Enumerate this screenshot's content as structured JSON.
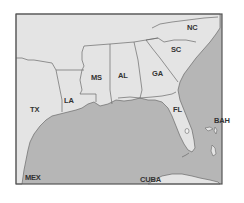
{
  "map": {
    "type": "regional reference map",
    "region": "Southeastern United States and Gulf of Mexico",
    "colors": {
      "land": "#e4e4e4",
      "water": "#b6b6b6",
      "border": "#6a6a6a",
      "frame": "#555555",
      "label": "#333333"
    },
    "labels": {
      "tx": "TX",
      "la": "LA",
      "ms": "MS",
      "al": "AL",
      "ga": "GA",
      "sc": "SC",
      "nc": "NC",
      "fl": "FL",
      "bah": "BAH",
      "cuba": "CUBA",
      "mex": "MEX"
    }
  }
}
